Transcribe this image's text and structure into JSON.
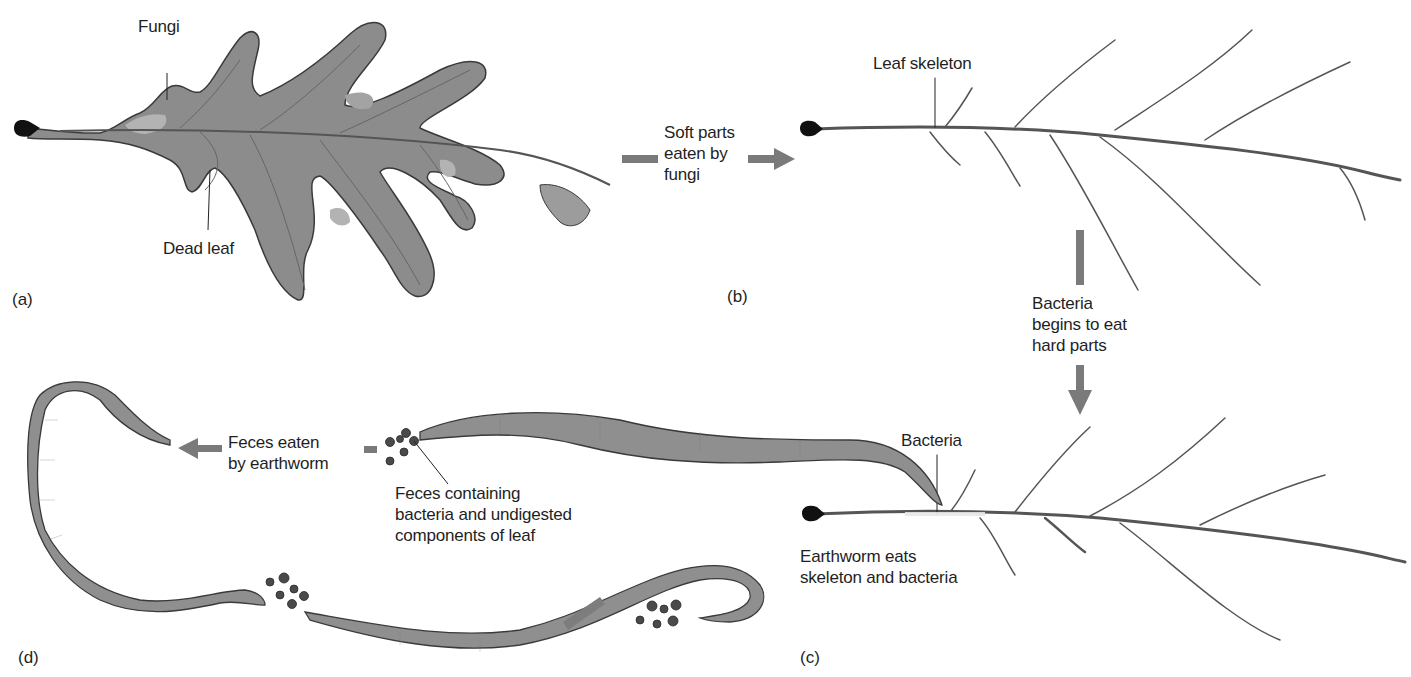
{
  "figure": {
    "panels": [
      {
        "id": "a",
        "label": "(a)",
        "labels": [
          "Fungi",
          "Dead leaf"
        ]
      },
      {
        "id": "b",
        "label": "(b)",
        "labels": [
          "Leaf skeleton"
        ]
      },
      {
        "id": "c",
        "label": "(c)",
        "labels": [
          "Bacteria",
          "Earthworm eats skeleton and bacteria"
        ]
      },
      {
        "id": "d",
        "label": "(d)",
        "labels": [
          "Feces containing bacteria and undigested components of leaf"
        ]
      }
    ],
    "labels": {
      "fungi": "Fungi",
      "dead_leaf": "Dead leaf",
      "leaf_skeleton": "Leaf skeleton",
      "bacteria": "Bacteria",
      "earthworm_eats_1": "Earthworm eats",
      "earthworm_eats_2": "skeleton and bacteria",
      "feces_1": "Feces containing",
      "feces_2": "bacteria and undigested",
      "feces_3": "components of leaf"
    },
    "transitions": {
      "a_to_b": [
        "Soft parts",
        "eaten by",
        "fungi"
      ],
      "b_to_c": [
        "Bacteria",
        "begins to eat",
        "hard parts"
      ],
      "d_cycle": [
        "Feces eaten",
        "by earthworm"
      ]
    },
    "panel_letters": {
      "a": "(a)",
      "b": "(b)",
      "c": "(c)",
      "d": "(d)"
    },
    "colors": {
      "leaf_fill": "#8c8c8c",
      "leaf_light": "#a8a8a8",
      "leaf_outline": "#3a3a3a",
      "petiole": "#111111",
      "vein": "#555555",
      "arrow": "#7a7a7a",
      "worm": "#8f8f8f",
      "feces": "#4a4a4a"
    }
  }
}
